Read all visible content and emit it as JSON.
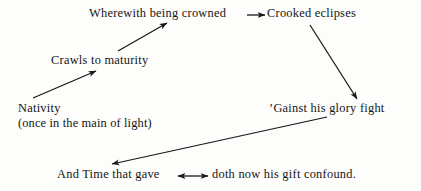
{
  "diagram": {
    "background_color": "#fdfdfb",
    "ink_color": "#151515",
    "nodes": [
      {
        "id": "wherewith",
        "text": "Wherewith being crowned"
      },
      {
        "id": "crooked",
        "text": "Crooked eclipses"
      },
      {
        "id": "crawls",
        "text": "Crawls to maturity"
      },
      {
        "id": "nativity",
        "text": "Nativity",
        "subtext": "(once in the main of light)"
      },
      {
        "id": "gainst",
        "text": "’Gainst his glory fight"
      },
      {
        "id": "andtime",
        "text": "And Time that gave"
      },
      {
        "id": "doth",
        "text": "doth now his gift confound."
      }
    ],
    "arrows": [
      {
        "id": "nativity-to-crawls",
        "from": "nativity",
        "to": "crawls",
        "heads": "single"
      },
      {
        "id": "crawls-to-wherewith",
        "from": "crawls",
        "to": "wherewith",
        "heads": "single"
      },
      {
        "id": "wherewith-to-crooked",
        "from": "wherewith",
        "to": "crooked",
        "heads": "single"
      },
      {
        "id": "crooked-to-gainst",
        "from": "crooked",
        "to": "gainst",
        "heads": "single"
      },
      {
        "id": "gainst-to-andtime",
        "from": "gainst",
        "to": "andtime",
        "heads": "single"
      },
      {
        "id": "andtime-doth-bidirectional",
        "from": "andtime",
        "to": "doth",
        "heads": "double"
      }
    ]
  }
}
